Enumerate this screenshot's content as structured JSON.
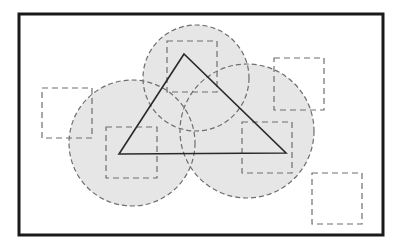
{
  "diagram": {
    "colors": {
      "background": "#ffffff",
      "frame": "#1a1a1a",
      "circle_fill": "#e6e6e6",
      "circle_stroke": "#6e6e6e",
      "square_stroke": "#6e6e6e",
      "triangle_stroke": "#2a2a2a"
    },
    "frame": {
      "x": 19,
      "y": 14,
      "width": 364,
      "height": 221,
      "stroke_width": 3
    },
    "circles": [
      {
        "id": "circle-left",
        "cx": 132,
        "cy": 143,
        "r": 63
      },
      {
        "id": "circle-right",
        "cx": 247,
        "cy": 131,
        "r": 67
      },
      {
        "id": "circle-top",
        "cx": 196,
        "cy": 78,
        "r": 53
      }
    ],
    "squares": [
      {
        "id": "square-top",
        "x": 167,
        "y": 41,
        "width": 50,
        "height": 51
      },
      {
        "id": "square-left",
        "x": 42,
        "y": 88,
        "width": 50,
        "height": 50
      },
      {
        "id": "square-top-right",
        "x": 274,
        "y": 58,
        "width": 50,
        "height": 52
      },
      {
        "id": "square-bottom-left",
        "x": 106,
        "y": 127,
        "width": 51,
        "height": 51
      },
      {
        "id": "square-right",
        "x": 242,
        "y": 122,
        "width": 50,
        "height": 51
      },
      {
        "id": "square-bottom-right",
        "x": 312,
        "y": 173,
        "width": 50,
        "height": 51
      }
    ],
    "triangle": {
      "points": [
        [
          184,
          54
        ],
        [
          119,
          154
        ],
        [
          286,
          153
        ]
      ]
    }
  }
}
